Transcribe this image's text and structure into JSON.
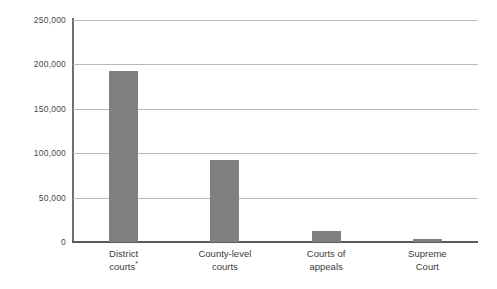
{
  "chart_data": {
    "type": "bar",
    "title": "",
    "subtitle": "",
    "xlabel": "",
    "ylabel": "",
    "categories": [
      "District courts*",
      "County-level courts",
      "Courts of appeals",
      "Supreme Court"
    ],
    "category_lines": [
      [
        "District",
        "courts"
      ],
      [
        "County-level",
        "courts"
      ],
      [
        "Courts of",
        "appeals"
      ],
      [
        "Supreme",
        "Court"
      ]
    ],
    "category_footnotes": [
      "*",
      "",
      "",
      ""
    ],
    "values": [
      192500,
      92500,
      12000,
      3000
    ],
    "ylim": [
      0,
      250000
    ],
    "yticks": [
      0,
      50000,
      100000,
      150000,
      200000,
      250000
    ],
    "ytick_labels": [
      "0",
      "50,000",
      "100,000",
      "150,000",
      "200,000",
      "250,000"
    ],
    "grid": "horizontal",
    "legend": "none",
    "bar_color": "#808080",
    "gridline_color": "#b9b9b9",
    "axis_color": "#5a5a5a",
    "background_color": "#ffffff"
  }
}
